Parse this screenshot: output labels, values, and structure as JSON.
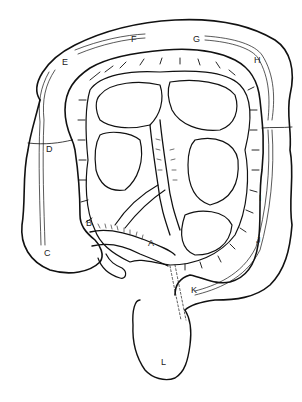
{
  "diagram": {
    "stroke_color": "#111111",
    "background": "#ffffff",
    "labels": [
      {
        "id": "A",
        "text": "A",
        "x": 148,
        "y": 244
      },
      {
        "id": "B",
        "text": "B",
        "x": 87,
        "y": 224
      },
      {
        "id": "C",
        "text": "C",
        "x": 45,
        "y": 253
      },
      {
        "id": "D",
        "text": "D",
        "x": 46,
        "y": 148
      },
      {
        "id": "E",
        "text": "E",
        "x": 62,
        "y": 60
      },
      {
        "id": "F",
        "text": "F",
        "x": 131,
        "y": 36
      },
      {
        "id": "G",
        "text": "G",
        "x": 193,
        "y": 36
      },
      {
        "id": "H",
        "text": "H",
        "x": 254,
        "y": 57
      },
      {
        "id": "I",
        "text": "I",
        "x": 259,
        "y": 197
      },
      {
        "id": "J",
        "text": "J",
        "x": 256,
        "y": 238
      },
      {
        "id": "K",
        "text": "K",
        "x": 191,
        "y": 288
      },
      {
        "id": "L",
        "text": "L",
        "x": 161,
        "y": 360
      }
    ]
  }
}
